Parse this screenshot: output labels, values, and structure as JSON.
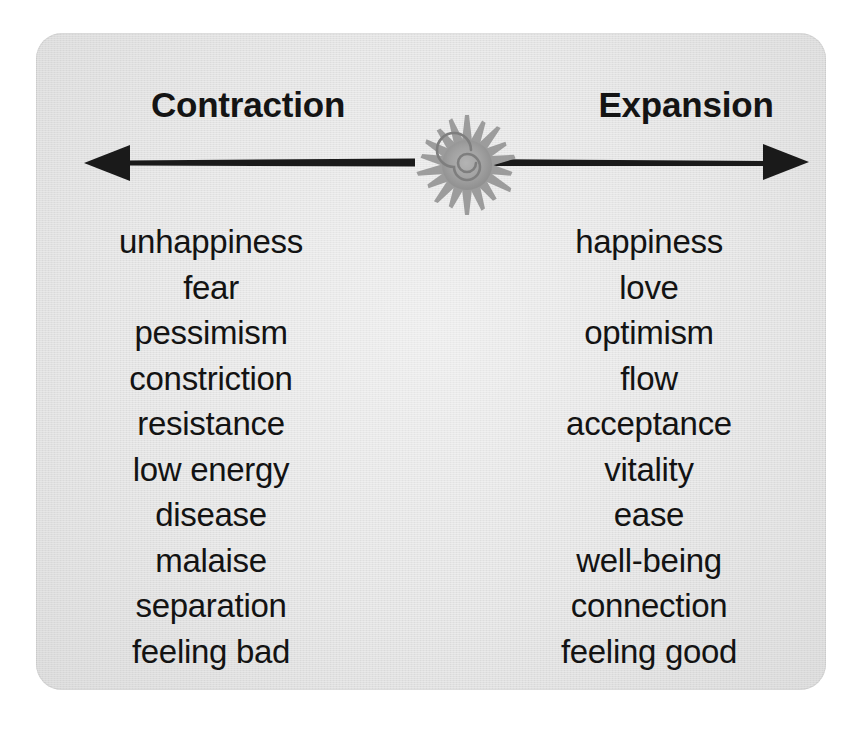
{
  "figure": {
    "panel_color": "#e4e4e4",
    "text_color": "#131313",
    "arrow_color": "#1a1a1a",
    "sun_color": "#9a9a9a"
  },
  "headings": {
    "left": "Contraction",
    "right": "Expansion"
  },
  "axis": {
    "left_arrow_icon": "arrow-left-icon",
    "right_arrow_icon": "arrow-right-icon",
    "center_icon": "sun-spiral-icon"
  },
  "columns": {
    "left": {
      "heading": "Contraction",
      "words": [
        "unhappiness",
        "fear",
        "pessimism",
        "constriction",
        "resistance",
        "low energy",
        "disease",
        "malaise",
        "separation",
        "feeling bad"
      ]
    },
    "right": {
      "heading": "Expansion",
      "words": [
        "happiness",
        "love",
        "optimism",
        "flow",
        "acceptance",
        "vitality",
        "ease",
        "well-being",
        "connection",
        "feeling good"
      ]
    }
  }
}
